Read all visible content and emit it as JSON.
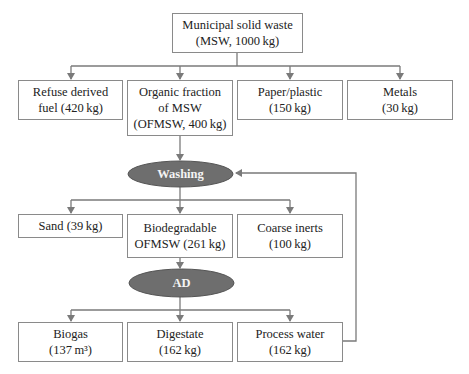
{
  "diagram": {
    "nodes": {
      "msw": [
        "Municipal solid waste",
        "(MSW, 1000 kg)"
      ],
      "rdf": [
        "Refuse derived",
        "fuel (420 kg)"
      ],
      "ofmsw": [
        "Organic fraction",
        "of MSW",
        "(OFMSW, 400 kg)"
      ],
      "paper": [
        "Paper/plastic",
        "(150 kg)"
      ],
      "metals": [
        "Metals",
        "(30 kg)"
      ],
      "washing": "Washing",
      "sand": [
        "Sand (39 kg)"
      ],
      "bio_ofmsw": [
        "Biodegradable",
        "OFMSW (261 kg)"
      ],
      "coarse": [
        "Coarse inerts",
        "(100 kg)"
      ],
      "ad": "AD",
      "biogas": [
        "Biogas",
        "(137 m³)"
      ],
      "digestate": [
        "Digestate",
        "(162 kg)"
      ],
      "water": [
        "Process water",
        "(162 kg)"
      ]
    },
    "colors": {
      "line": "#7a7a7a",
      "ellipse": "#6e6e6e",
      "ellipse_text": "#f4f4f4"
    }
  }
}
